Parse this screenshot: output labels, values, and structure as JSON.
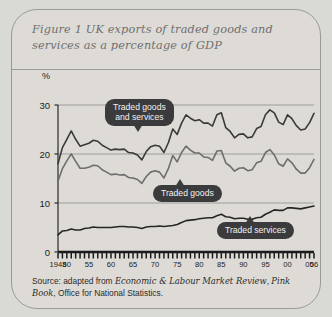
{
  "figure": {
    "title": "Figure 1   UK exports of traded goods and services as a percentage of GDP",
    "source_prefix": "Source: adapted from ",
    "source_italic_1": "Economic & Labour Market Review",
    "source_mid": ", ",
    "source_italic_2": "Pink Book",
    "source_suffix": ",  Office for National Statistics."
  },
  "axes": {
    "y_unit": "%",
    "y_ticks": [
      "30",
      "20",
      "10",
      "0"
    ],
    "x_ticks": [
      "1948",
      "50",
      "55",
      "60",
      "65",
      "70",
      "75",
      "80",
      "85",
      "90",
      "95",
      "00",
      "05",
      "06"
    ]
  },
  "callouts": {
    "total": "Traded goods\nand services",
    "goods": "Traded goods",
    "services": "Traded services"
  },
  "colors": {
    "card_bg": "#dedbd6",
    "page_bg": "#d9d9d6",
    "border": "#9a9a96",
    "title_text": "#6f6f70",
    "line_total": "#3a3a3a",
    "line_goods": "#6e6e6e",
    "line_services": "#262626",
    "gridline": "#8d8d8a",
    "callout_bg": "#3b3b3d",
    "callout_text": "#f2f2f2"
  },
  "chart_data": {
    "type": "line",
    "title": "Figure 1  UK exports of traded goods and services as a percentage of GDP",
    "xlabel": "",
    "ylabel": "%",
    "ylim": [
      0,
      30
    ],
    "xlim": [
      1948,
      2006
    ],
    "grid": true,
    "legend": "inline-callouts",
    "x": [
      1948,
      1949,
      1950,
      1951,
      1952,
      1953,
      1954,
      1955,
      1956,
      1957,
      1958,
      1959,
      1960,
      1961,
      1962,
      1963,
      1964,
      1965,
      1966,
      1967,
      1968,
      1969,
      1970,
      1971,
      1972,
      1973,
      1974,
      1975,
      1976,
      1977,
      1978,
      1979,
      1980,
      1981,
      1982,
      1983,
      1984,
      1985,
      1986,
      1987,
      1988,
      1989,
      1990,
      1991,
      1992,
      1993,
      1994,
      1995,
      1996,
      1997,
      1998,
      1999,
      2000,
      2001,
      2002,
      2003,
      2004,
      2005,
      2006
    ],
    "series": [
      {
        "name": "Traded goods and services",
        "color": "#3a3a3a",
        "values": [
          18.0,
          21.3,
          23.0,
          24.7,
          23.0,
          21.6,
          21.9,
          22.2,
          22.8,
          22.6,
          21.8,
          21.3,
          20.8,
          21.0,
          20.9,
          21.0,
          20.3,
          20.2,
          19.8,
          18.8,
          20.5,
          21.5,
          21.8,
          21.6,
          20.3,
          22.3,
          25.1,
          24.0,
          26.3,
          28.0,
          27.3,
          26.8,
          27.0,
          26.3,
          26.3,
          25.7,
          28.0,
          28.4,
          25.4,
          24.6,
          23.3,
          24.0,
          24.1,
          23.3,
          23.5,
          25.2,
          25.6,
          28.0,
          29.0,
          28.4,
          26.5,
          26.0,
          28.0,
          27.2,
          25.8,
          24.9,
          25.1,
          26.4,
          28.3
        ]
      },
      {
        "name": "Traded goods",
        "color": "#6e6e6e",
        "values": [
          14.5,
          17.0,
          18.6,
          20.0,
          18.5,
          17.1,
          17.1,
          17.3,
          17.7,
          17.6,
          16.8,
          16.3,
          15.8,
          15.9,
          15.7,
          15.8,
          15.2,
          15.1,
          14.8,
          14.0,
          15.4,
          16.3,
          16.6,
          16.3,
          15.1,
          17.0,
          19.7,
          18.4,
          20.3,
          21.6,
          20.8,
          20.2,
          20.2,
          19.4,
          19.3,
          18.7,
          20.6,
          20.7,
          18.2,
          17.5,
          16.5,
          17.1,
          17.2,
          16.6,
          16.8,
          18.2,
          18.5,
          20.3,
          20.9,
          19.8,
          18.0,
          17.5,
          19.0,
          18.2,
          16.9,
          16.1,
          16.1,
          17.2,
          18.9
        ]
      },
      {
        "name": "Traded services",
        "color": "#262626",
        "values": [
          3.5,
          4.3,
          4.4,
          4.7,
          4.5,
          4.5,
          4.8,
          4.9,
          5.1,
          5.0,
          5.0,
          5.0,
          5.0,
          5.1,
          5.2,
          5.2,
          5.1,
          5.1,
          5.0,
          4.8,
          5.1,
          5.2,
          5.2,
          5.3,
          5.2,
          5.3,
          5.4,
          5.6,
          6.0,
          6.4,
          6.5,
          6.6,
          6.8,
          6.9,
          7.0,
          7.0,
          7.4,
          7.7,
          7.2,
          7.1,
          6.8,
          6.9,
          6.9,
          6.7,
          6.7,
          7.0,
          7.1,
          7.7,
          8.1,
          8.6,
          8.5,
          8.5,
          9.0,
          9.0,
          8.9,
          8.8,
          9.0,
          9.2,
          9.4
        ]
      }
    ]
  }
}
